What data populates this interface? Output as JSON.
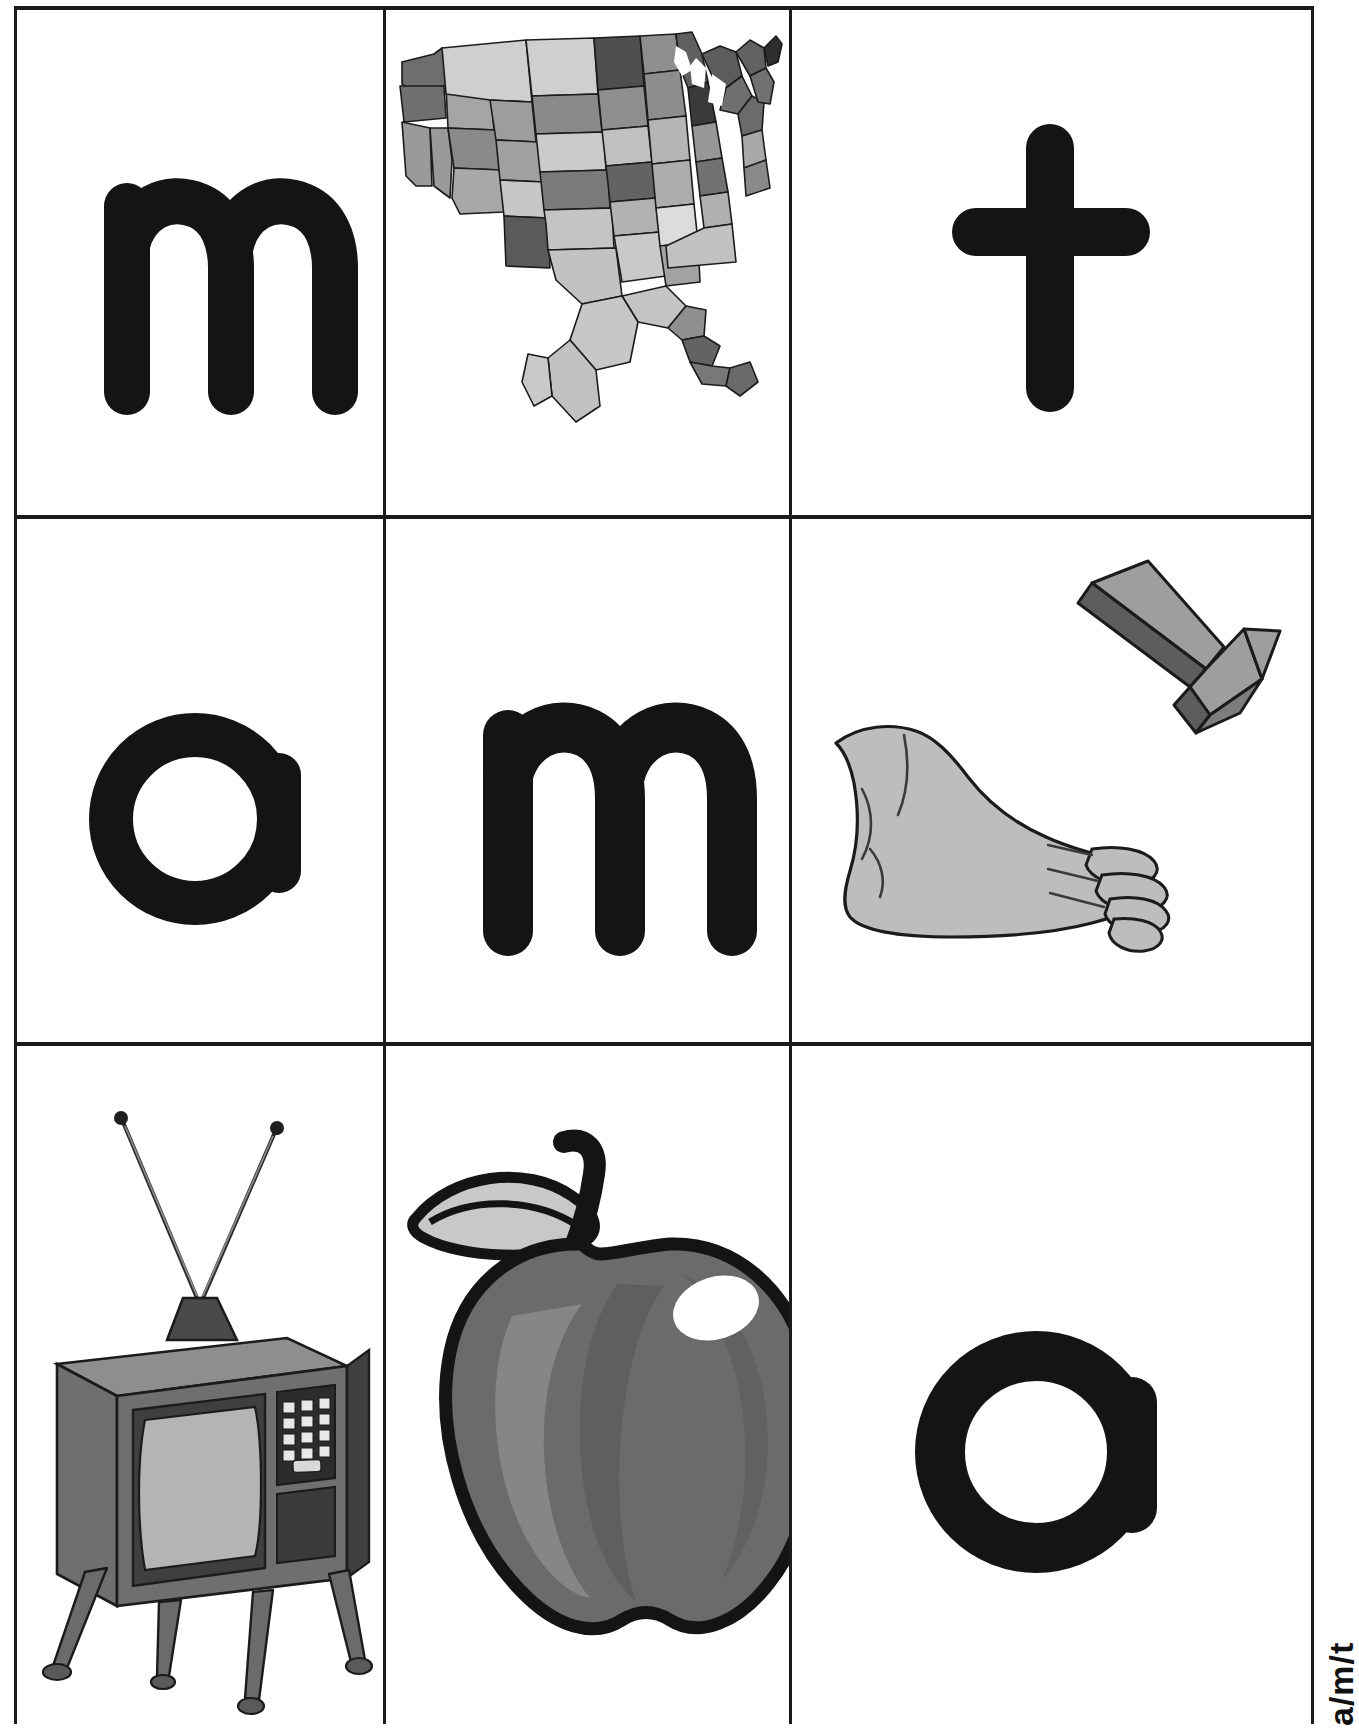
{
  "page": {
    "kind": "phonics-flashcard-sheet",
    "background": "#ffffff",
    "ink": "#141414",
    "rule_color": "#1b1b1b",
    "footer_label": "a/m/t",
    "rows": 3,
    "columns": 3
  },
  "palette": {
    "ink": "#141414",
    "rule": "#1b1b1b",
    "map_dark": "#4f4f4f",
    "map_mid": "#8d8d8d",
    "map_light": "#c3c3c3",
    "map_pale": "#dcdcdc",
    "outline": "#1b1b1b",
    "skin": "#bdbdbd",
    "arrow_face": "#9e9e9e",
    "arrow_side": "#5d5d5d",
    "tv_body": "#6f6f6f",
    "tv_body_dark": "#3f3f3f",
    "tv_screen": "#b4b4b4",
    "tv_top": "#8e8e8e",
    "apple_body": "#6b6b6b",
    "apple_shade": "#565656",
    "apple_light": "#8b8b8b",
    "leaf": "#c8c8c8",
    "highlight": "#ffffff"
  },
  "cards": [
    {
      "id": "card-m-1",
      "row": 0,
      "col": 0,
      "type": "letter",
      "value": "m",
      "name": "letter-m-card"
    },
    {
      "id": "card-map",
      "row": 0,
      "col": 1,
      "type": "picture",
      "value": "map",
      "name": "picture-map-card",
      "caption": "map"
    },
    {
      "id": "card-t",
      "row": 0,
      "col": 2,
      "type": "letter",
      "value": "t",
      "name": "letter-t-card"
    },
    {
      "id": "card-a-1",
      "row": 1,
      "col": 0,
      "type": "letter",
      "value": "a",
      "name": "letter-a-card"
    },
    {
      "id": "card-m-2",
      "row": 1,
      "col": 1,
      "type": "letter",
      "value": "m",
      "name": "letter-m-card"
    },
    {
      "id": "card-foot",
      "row": 1,
      "col": 2,
      "type": "picture",
      "value": "foot",
      "name": "picture-foot-card",
      "caption": "foot"
    },
    {
      "id": "card-tv",
      "row": 2,
      "col": 0,
      "type": "picture",
      "value": "television",
      "name": "picture-tv-card",
      "caption": "TV"
    },
    {
      "id": "card-apple",
      "row": 2,
      "col": 1,
      "type": "picture",
      "value": "apple",
      "name": "picture-apple-card",
      "caption": "apple"
    },
    {
      "id": "card-a-2",
      "row": 2,
      "col": 2,
      "type": "letter",
      "value": "a",
      "name": "letter-a-card"
    }
  ],
  "letters": {
    "m_top_left": "m",
    "t_top_right": "t",
    "a_mid_left": "a",
    "m_mid_center": "m",
    "a_bottom_right": "a"
  },
  "pictures": {
    "map": {
      "label": "map",
      "description": "united-states-map"
    },
    "foot": {
      "label": "foot",
      "description": "foot-with-arrow-pointing-to-toes"
    },
    "tv": {
      "label": "TV",
      "description": "vintage-television-with-antenna"
    },
    "apple": {
      "label": "apple",
      "description": "apple-with-leaf-and-stem"
    }
  }
}
